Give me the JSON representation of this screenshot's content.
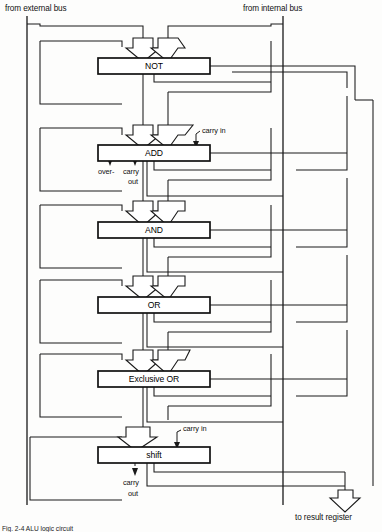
{
  "figure": {
    "caption": "Fig. 2-4 ALU logic circuit"
  },
  "inputs": [
    {
      "id": "external-bus",
      "label": "from external bus",
      "x": 5,
      "y": 4
    },
    {
      "id": "internal-bus",
      "label": "from internal bus",
      "x": 243,
      "y": 4
    }
  ],
  "output": {
    "id": "result-register",
    "label": "to result register",
    "x": 295,
    "y": 513
  },
  "units": [
    {
      "id": "not",
      "label": "NOT",
      "x": 98,
      "y": 58,
      "w": 112,
      "h": 16
    },
    {
      "id": "add",
      "label": "ADD",
      "x": 98,
      "y": 145,
      "w": 112,
      "h": 16
    },
    {
      "id": "and",
      "label": "AND",
      "x": 98,
      "y": 222,
      "w": 112,
      "h": 16
    },
    {
      "id": "or",
      "label": "OR",
      "x": 98,
      "y": 297,
      "w": 112,
      "h": 16
    },
    {
      "id": "exclusive-or",
      "label": "Exclusive OR",
      "x": 98,
      "y": 371,
      "w": 112,
      "h": 16
    },
    {
      "id": "shift",
      "label": "shift",
      "x": 98,
      "y": 447,
      "w": 112,
      "h": 16
    }
  ],
  "signals": [
    {
      "id": "add-carry-in",
      "label": "carry in",
      "x": 202,
      "y": 130
    },
    {
      "id": "add-overflow",
      "label": "over-",
      "x": 100,
      "y": 166
    },
    {
      "id": "add-carry",
      "label": "carry",
      "x": 125,
      "y": 166
    },
    {
      "id": "add-carry-out",
      "label": "out",
      "x": 129,
      "y": 176
    },
    {
      "id": "shift-carry-in",
      "label": "carry in",
      "x": 183,
      "y": 428
    },
    {
      "id": "shift-carry",
      "label": "carry",
      "x": 125,
      "y": 478
    },
    {
      "id": "shift-carry-out",
      "label": "out",
      "x": 129,
      "y": 489
    }
  ],
  "colors": {
    "line": "#1a1a1a",
    "box_fill": "#ffffff",
    "background": "#fdfdfc",
    "text": "#111111"
  }
}
